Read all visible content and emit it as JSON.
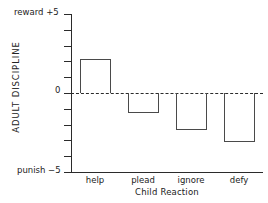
{
  "chart_data": {
    "type": "bar",
    "title": "",
    "xlabel": "Child Reaction",
    "ylabel": "ADULT DISCIPLINE",
    "categories": [
      "help",
      "plead",
      "ignore",
      "defy"
    ],
    "values": [
      2.15,
      -1.25,
      -2.35,
      -3.1
    ],
    "ylim": [
      -5,
      5
    ],
    "yticks": [
      -5,
      -4,
      -3,
      -2,
      -1,
      0,
      1,
      2,
      3,
      4,
      5
    ],
    "ytick_labels_shown": {
      "top": "+5",
      "zero": "0",
      "bottom": "−5"
    },
    "axis_end_labels": {
      "top": "reward  +5",
      "bottom": "punish  −5",
      "zero": "0"
    },
    "grid": false,
    "legend": false,
    "zero_reference_line": {
      "value": 0,
      "style": "dashed"
    },
    "bar_style": {
      "fill": "none",
      "stroke": "#4a4a4a"
    }
  },
  "colors": {
    "axis": "#2b2b2b",
    "bar_stroke": "#4a4a4a",
    "text": "#222222",
    "background": "#ffffff"
  },
  "labels": {
    "y_axis_title": "ADULT DISCIPLINE",
    "x_axis_title": "Child Reaction",
    "reward_top": "reward  +5",
    "punish_bottom": "punish  −5",
    "zero": "0"
  }
}
